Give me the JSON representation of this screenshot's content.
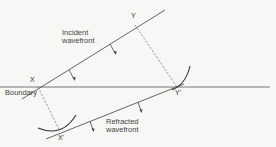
{
  "diagram": {
    "labels": {
      "boundary": "Boundary",
      "incident_line1": "Incident",
      "incident_line2": "wavefront",
      "refracted_line1": "Refracted",
      "refracted_line2": "wavefront"
    },
    "points": {
      "x": "X",
      "y": "Y",
      "y_prime": "Y'",
      "x_prime": "X'"
    },
    "colors": {
      "line": "#555555",
      "arc": "#333333",
      "background": "#f7f7f5",
      "text": "#444444"
    }
  }
}
